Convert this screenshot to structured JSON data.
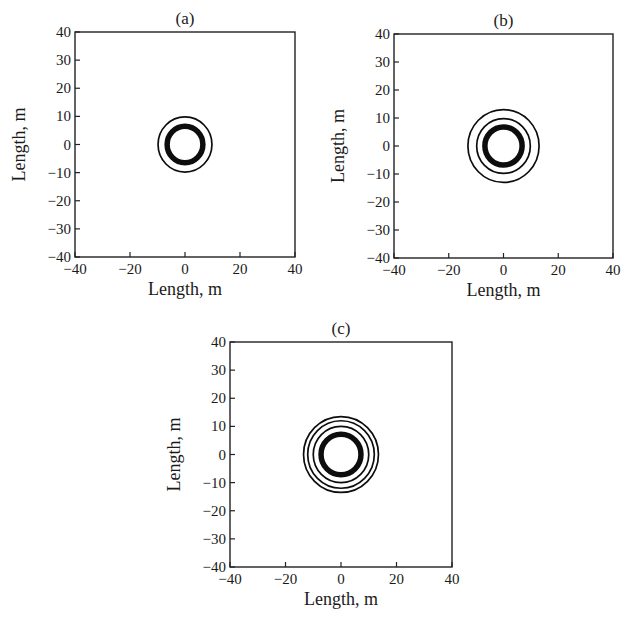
{
  "figure": {
    "panels": [
      "a",
      "b",
      "c"
    ]
  },
  "chart_data": [
    {
      "type": "contour",
      "title": "(a)",
      "xlabel": "Length, m",
      "ylabel": "Length, m",
      "xlim": [
        -40,
        40
      ],
      "ylim": [
        -40,
        40
      ],
      "xticks": [
        -40,
        -20,
        0,
        20,
        40
      ],
      "yticks": [
        -40,
        -30,
        -20,
        -10,
        0,
        10,
        20,
        30,
        40
      ],
      "xtick_labels": [
        "−40",
        "−20",
        "0",
        "20",
        "40"
      ],
      "ytick_labels": [
        "−40",
        "−30",
        "−20",
        "−10",
        "0",
        "10",
        "20",
        "30",
        "40"
      ],
      "grid": false,
      "center": [
        0,
        0
      ],
      "rings": [
        {
          "radius": 9.8,
          "weight": "thin"
        },
        {
          "radius": 6.5,
          "weight": "thick"
        }
      ]
    },
    {
      "type": "contour",
      "title": "(b)",
      "xlabel": "Length, m",
      "ylabel": "Length, m",
      "xlim": [
        -40,
        40
      ],
      "ylim": [
        -40,
        40
      ],
      "xticks": [
        -40,
        -20,
        0,
        20,
        40
      ],
      "yticks": [
        -40,
        -30,
        -20,
        -10,
        0,
        10,
        20,
        30,
        40
      ],
      "xtick_labels": [
        "−40",
        "−20",
        "0",
        "20",
        "40"
      ],
      "ytick_labels": [
        "−40",
        "−30",
        "−20",
        "−10",
        "0",
        "10",
        "20",
        "30",
        "40"
      ],
      "grid": false,
      "center": [
        0,
        0
      ],
      "rings": [
        {
          "radius": 13.0,
          "weight": "thin"
        },
        {
          "radius": 9.8,
          "weight": "thin"
        },
        {
          "radius": 6.8,
          "weight": "thick"
        }
      ]
    },
    {
      "type": "contour",
      "title": "(c)",
      "xlabel": "Length, m",
      "ylabel": "Length, m",
      "xlim": [
        -40,
        40
      ],
      "ylim": [
        -40,
        40
      ],
      "xticks": [
        -40,
        -20,
        0,
        20,
        40
      ],
      "yticks": [
        -40,
        -30,
        -20,
        -10,
        0,
        10,
        20,
        30,
        40
      ],
      "xtick_labels": [
        "−40",
        "−20",
        "0",
        "20",
        "40"
      ],
      "ytick_labels": [
        "−40",
        "−30",
        "−20",
        "−10",
        "0",
        "10",
        "20",
        "30",
        "40"
      ],
      "grid": false,
      "center": [
        0,
        0
      ],
      "rings": [
        {
          "radius": 13.5,
          "weight": "thin"
        },
        {
          "radius": 12.0,
          "weight": "thin"
        },
        {
          "radius": 10.0,
          "weight": "thin"
        },
        {
          "radius": 7.2,
          "weight": "thick"
        }
      ]
    }
  ]
}
